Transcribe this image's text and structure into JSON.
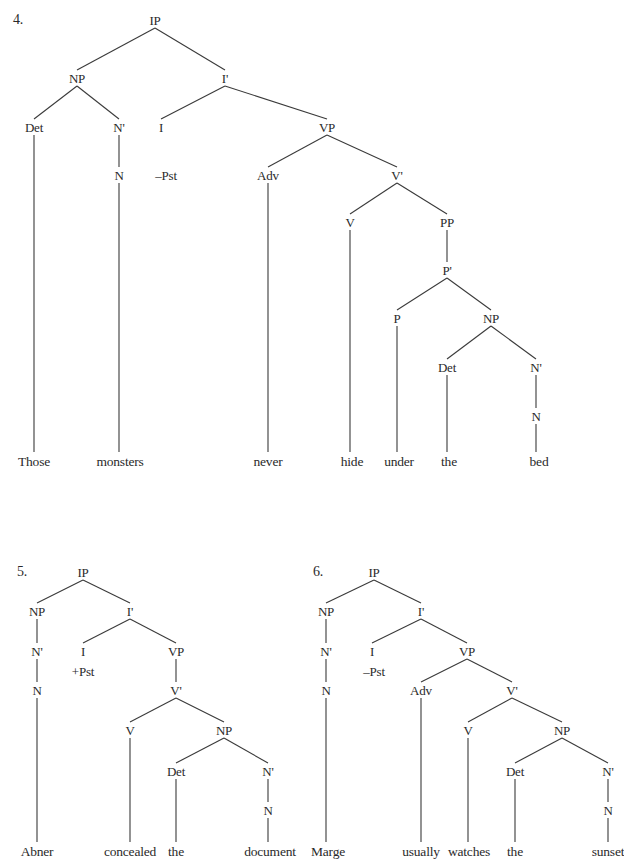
{
  "trees": [
    {
      "number": "4.",
      "nodes": [
        {
          "id": "ip",
          "label": "IP",
          "x": 155,
          "y": 20
        },
        {
          "id": "np",
          "label": "NP",
          "x": 77,
          "y": 78
        },
        {
          "id": "ibar",
          "label": "I'",
          "x": 225,
          "y": 78
        },
        {
          "id": "det",
          "label": "Det",
          "x": 34,
          "y": 127
        },
        {
          "id": "nbar",
          "label": "N'",
          "x": 119,
          "y": 127
        },
        {
          "id": "i",
          "label": "I",
          "x": 161,
          "y": 127
        },
        {
          "id": "vp",
          "label": "VP",
          "x": 327,
          "y": 127
        },
        {
          "id": "n",
          "label": "N",
          "x": 119,
          "y": 175
        },
        {
          "id": "tense",
          "label": "–Pst",
          "x": 166,
          "y": 175
        },
        {
          "id": "adv",
          "label": "Adv",
          "x": 268,
          "y": 175
        },
        {
          "id": "vbar",
          "label": "V'",
          "x": 397,
          "y": 175
        },
        {
          "id": "v",
          "label": "V",
          "x": 350,
          "y": 222
        },
        {
          "id": "pp",
          "label": "PP",
          "x": 447,
          "y": 222
        },
        {
          "id": "pbar",
          "label": "P'",
          "x": 447,
          "y": 270
        },
        {
          "id": "p",
          "label": "P",
          "x": 397,
          "y": 318
        },
        {
          "id": "np2",
          "label": "NP",
          "x": 491,
          "y": 318
        },
        {
          "id": "det2",
          "label": "Det",
          "x": 447,
          "y": 367
        },
        {
          "id": "nbar2",
          "label": "N'",
          "x": 536,
          "y": 367
        },
        {
          "id": "n2",
          "label": "N",
          "x": 536,
          "y": 416
        }
      ],
      "words": [
        {
          "text": "Those",
          "x": 34,
          "y": 462
        },
        {
          "text": "monsters",
          "x": 120,
          "y": 462
        },
        {
          "text": "never",
          "x": 268,
          "y": 462
        },
        {
          "text": "hide",
          "x": 352,
          "y": 462
        },
        {
          "text": "under",
          "x": 399,
          "y": 462
        },
        {
          "text": "the",
          "x": 449,
          "y": 462
        },
        {
          "text": "bed",
          "x": 539,
          "y": 462
        }
      ]
    },
    {
      "number": "5.",
      "nodes": [
        {
          "id": "ip",
          "label": "IP",
          "x": 83,
          "y": 572
        },
        {
          "id": "np",
          "label": "NP",
          "x": 37,
          "y": 611
        },
        {
          "id": "ibar",
          "label": "I'",
          "x": 130,
          "y": 611
        },
        {
          "id": "nbar",
          "label": "N'",
          "x": 37,
          "y": 651
        },
        {
          "id": "i",
          "label": "I",
          "x": 83,
          "y": 651
        },
        {
          "id": "vp",
          "label": "VP",
          "x": 176,
          "y": 651
        },
        {
          "id": "tense",
          "label": "+Pst",
          "x": 83,
          "y": 671
        },
        {
          "id": "n",
          "label": "N",
          "x": 37,
          "y": 690
        },
        {
          "id": "vbar",
          "label": "V'",
          "x": 176,
          "y": 690
        },
        {
          "id": "v",
          "label": "V",
          "x": 130,
          "y": 730
        },
        {
          "id": "np2",
          "label": "NP",
          "x": 224,
          "y": 730
        },
        {
          "id": "det",
          "label": "Det",
          "x": 176,
          "y": 771
        },
        {
          "id": "nbar2",
          "label": "N'",
          "x": 268,
          "y": 771
        },
        {
          "id": "n2",
          "label": "N",
          "x": 268,
          "y": 810
        }
      ],
      "words": [
        {
          "text": "Abner",
          "x": 37,
          "y": 852
        },
        {
          "text": "concealed",
          "x": 130,
          "y": 852
        },
        {
          "text": "the",
          "x": 176,
          "y": 852
        },
        {
          "text": "document",
          "x": 270,
          "y": 852
        }
      ]
    },
    {
      "number": "6.",
      "nodes": [
        {
          "id": "ip",
          "label": "IP",
          "x": 374,
          "y": 572
        },
        {
          "id": "np",
          "label": "NP",
          "x": 326,
          "y": 611
        },
        {
          "id": "ibar",
          "label": "I'",
          "x": 421,
          "y": 611
        },
        {
          "id": "nbar",
          "label": "N'",
          "x": 326,
          "y": 651
        },
        {
          "id": "i",
          "label": "I",
          "x": 372,
          "y": 651
        },
        {
          "id": "vp",
          "label": "VP",
          "x": 467,
          "y": 651
        },
        {
          "id": "tense",
          "label": "–Pst",
          "x": 374,
          "y": 671
        },
        {
          "id": "n",
          "label": "N",
          "x": 326,
          "y": 690
        },
        {
          "id": "adv",
          "label": "Adv",
          "x": 421,
          "y": 690
        },
        {
          "id": "vbar",
          "label": "V'",
          "x": 512,
          "y": 690
        },
        {
          "id": "v",
          "label": "V",
          "x": 468,
          "y": 730
        },
        {
          "id": "np2",
          "label": "NP",
          "x": 562,
          "y": 730
        },
        {
          "id": "det",
          "label": "Det",
          "x": 515,
          "y": 771
        },
        {
          "id": "nbar2",
          "label": "N'",
          "x": 608,
          "y": 771
        },
        {
          "id": "n2",
          "label": "N",
          "x": 608,
          "y": 810
        }
      ],
      "words": [
        {
          "text": "Marge",
          "x": 328,
          "y": 852
        },
        {
          "text": "usually",
          "x": 421,
          "y": 852
        },
        {
          "text": "watches",
          "x": 469,
          "y": 852
        },
        {
          "text": "the",
          "x": 515,
          "y": 852
        },
        {
          "text": "sunset",
          "x": 608,
          "y": 852
        }
      ]
    }
  ],
  "edges": [
    [
      0,
      "ip",
      "np"
    ],
    [
      0,
      "ip",
      "ibar"
    ],
    [
      0,
      "np",
      "det"
    ],
    [
      0,
      "np",
      "nbar"
    ],
    [
      0,
      "nbar",
      "n"
    ],
    [
      0,
      "ibar",
      "i"
    ],
    [
      0,
      "ibar",
      "vp"
    ],
    [
      0,
      "vp",
      "adv"
    ],
    [
      0,
      "vp",
      "vbar"
    ],
    [
      0,
      "vbar",
      "v"
    ],
    [
      0,
      "vbar",
      "pp"
    ],
    [
      0,
      "pp",
      "pbar"
    ],
    [
      0,
      "pbar",
      "p"
    ],
    [
      0,
      "pbar",
      "np2"
    ],
    [
      0,
      "np2",
      "det2"
    ],
    [
      0,
      "np2",
      "nbar2"
    ],
    [
      0,
      "nbar2",
      "n2"
    ],
    [
      1,
      "ip",
      "np"
    ],
    [
      1,
      "ip",
      "ibar"
    ],
    [
      1,
      "np",
      "nbar"
    ],
    [
      1,
      "nbar",
      "n"
    ],
    [
      1,
      "ibar",
      "i"
    ],
    [
      1,
      "ibar",
      "vp"
    ],
    [
      1,
      "vp",
      "vbar"
    ],
    [
      1,
      "vbar",
      "v"
    ],
    [
      1,
      "vbar",
      "np2"
    ],
    [
      1,
      "np2",
      "det"
    ],
    [
      1,
      "np2",
      "nbar2"
    ],
    [
      1,
      "nbar2",
      "n2"
    ],
    [
      2,
      "ip",
      "np"
    ],
    [
      2,
      "ip",
      "ibar"
    ],
    [
      2,
      "np",
      "nbar"
    ],
    [
      2,
      "nbar",
      "n"
    ],
    [
      2,
      "ibar",
      "i"
    ],
    [
      2,
      "ibar",
      "vp"
    ],
    [
      2,
      "vp",
      "adv"
    ],
    [
      2,
      "vp",
      "vbar"
    ],
    [
      2,
      "vbar",
      "v"
    ],
    [
      2,
      "vbar",
      "np2"
    ],
    [
      2,
      "np2",
      "det"
    ],
    [
      2,
      "np2",
      "nbar2"
    ],
    [
      2,
      "nbar2",
      "n2"
    ]
  ],
  "leaf_edges": [
    [
      0,
      "det",
      0
    ],
    [
      0,
      "n",
      1
    ],
    [
      0,
      "adv",
      2
    ],
    [
      0,
      "v",
      3
    ],
    [
      0,
      "p",
      4
    ],
    [
      0,
      "det2",
      5
    ],
    [
      0,
      "n2",
      6
    ],
    [
      1,
      "n",
      0
    ],
    [
      1,
      "v",
      1
    ],
    [
      1,
      "det",
      2
    ],
    [
      1,
      "n2",
      3
    ],
    [
      2,
      "n",
      0
    ],
    [
      2,
      "adv",
      1
    ],
    [
      2,
      "v",
      2
    ],
    [
      2,
      "det",
      3
    ],
    [
      2,
      "n2",
      4
    ]
  ],
  "number_positions": [
    {
      "x": 18,
      "y": 20
    },
    {
      "x": 22,
      "y": 572
    },
    {
      "x": 318,
      "y": 572
    }
  ]
}
